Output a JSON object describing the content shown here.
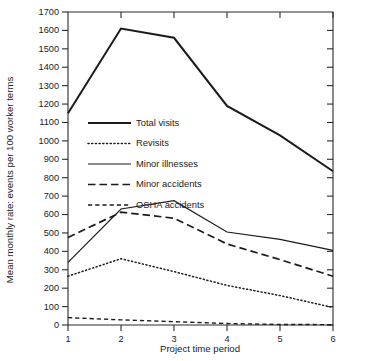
{
  "chart_data": {
    "type": "line",
    "title": "",
    "xlabel": "Project time period",
    "ylabel": "Mean monthly rate: events per 100 worker terms",
    "x": [
      1,
      2,
      3,
      4,
      5,
      6
    ],
    "categories": [
      "1",
      "2",
      "3",
      "4",
      "5",
      "6"
    ],
    "xlim": [
      1,
      6
    ],
    "ylim": [
      0,
      1700
    ],
    "ytick_step": 100,
    "yticks": [
      0,
      100,
      200,
      300,
      400,
      500,
      600,
      700,
      800,
      900,
      1000,
      1100,
      1200,
      1300,
      1400,
      1500,
      1600,
      1700
    ],
    "ytick_labels": [
      "0",
      "100",
      "200",
      "300",
      "400",
      "500",
      "600",
      "700",
      "800",
      "900",
      "1000",
      "1100",
      "1200",
      "1300",
      "1400",
      "1500",
      "1600",
      "1700"
    ],
    "xtick_labels": [
      "1",
      "2",
      "3",
      "4",
      "5",
      "6"
    ],
    "grid": false,
    "legend_position": "upper-left-inside",
    "series": [
      {
        "name": "Total visits",
        "style": "solid-thick",
        "values": [
          1150,
          1610,
          1560,
          1190,
          1030,
          835
        ]
      },
      {
        "name": "Revisits",
        "style": "dotted",
        "values": [
          265,
          360,
          290,
          215,
          160,
          95
        ]
      },
      {
        "name": "Minor illnesses",
        "style": "solid-thin",
        "values": [
          340,
          630,
          675,
          505,
          465,
          405
        ]
      },
      {
        "name": "Minor accidents",
        "style": "long-dash",
        "values": [
          475,
          613,
          580,
          440,
          355,
          265
        ]
      },
      {
        "name": "OSHA accidents",
        "style": "short-dash",
        "values": [
          40,
          28,
          18,
          8,
          3,
          2
        ]
      }
    ]
  },
  "legend": {
    "items": [
      {
        "label": "Total visits",
        "style": "solid-thick"
      },
      {
        "label": "Revisits",
        "style": "dotted"
      },
      {
        "label": "Minor illnesses",
        "style": "solid-thin"
      },
      {
        "label": "Minor accidents",
        "style": "long-dash"
      },
      {
        "label": "OSHA accidents",
        "style": "short-dash"
      }
    ]
  },
  "colors": {
    "ink": "#1b1b1b",
    "axis": "#2b2b2b",
    "background": "#ffffff"
  }
}
